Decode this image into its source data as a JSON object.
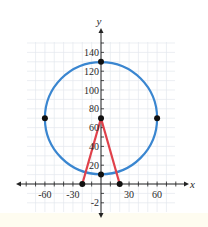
{
  "chart_data": {
    "type": "scatter",
    "title": "",
    "xlabel": "x",
    "ylabel": "y",
    "xlim": [
      -80,
      80
    ],
    "ylim": [
      -30,
      150
    ],
    "grid": true,
    "x_ticks": [
      -60,
      -30,
      30,
      60
    ],
    "x_tick_labels": [
      "-60",
      "-30",
      "30",
      "60"
    ],
    "y_ticks": [
      -20,
      20,
      40,
      60,
      80,
      100,
      120,
      140
    ],
    "y_tick_labels": [
      "-2",
      "20",
      "40",
      "60",
      "80",
      "100",
      "120",
      "140"
    ],
    "circle": {
      "center": [
        0,
        70
      ],
      "radius": 60,
      "color": "#3a86d0"
    },
    "segments": [
      {
        "from": [
          -20,
          0
        ],
        "to": [
          0,
          70
        ],
        "color": "#e0404a"
      },
      {
        "from": [
          0,
          70
        ],
        "to": [
          20,
          0
        ],
        "color": "#e0404a"
      }
    ],
    "points": [
      {
        "x": 0,
        "y": 130
      },
      {
        "x": -60,
        "y": 70
      },
      {
        "x": 60,
        "y": 70
      },
      {
        "x": 0,
        "y": 70
      },
      {
        "x": 0,
        "y": 10
      },
      {
        "x": -20,
        "y": 0
      },
      {
        "x": 20,
        "y": 0
      }
    ]
  },
  "colors": {
    "grid": "#e4e8ee",
    "axis": "#222222",
    "circle": "#3a86d0",
    "segment": "#e0404a",
    "point": "#111111"
  }
}
